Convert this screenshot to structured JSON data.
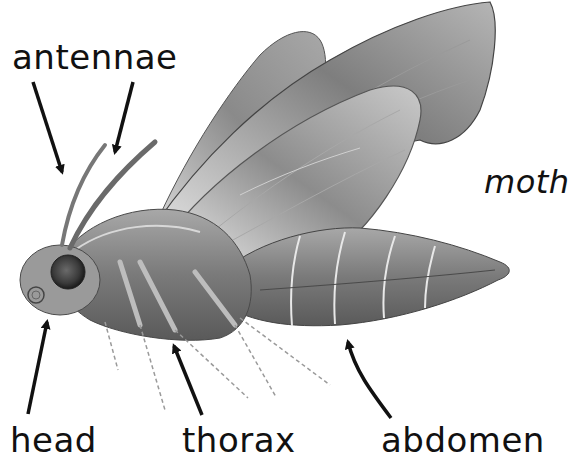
{
  "diagram": {
    "title": "moth",
    "labels": [
      {
        "id": "antennae",
        "text": "antennae",
        "arrow_count": 2
      },
      {
        "id": "head",
        "text": "head",
        "arrow_count": 1
      },
      {
        "id": "thorax",
        "text": "thorax",
        "arrow_count": 1
      },
      {
        "id": "abdomen",
        "text": "abdomen",
        "arrow_count": 1
      }
    ],
    "colors": {
      "background": "#ffffff",
      "text": "#111111",
      "arrow": "#111111",
      "wing_dark": "#6e6e6e",
      "wing_light": "#c8c8c8",
      "body": "#7a7a7a"
    }
  }
}
